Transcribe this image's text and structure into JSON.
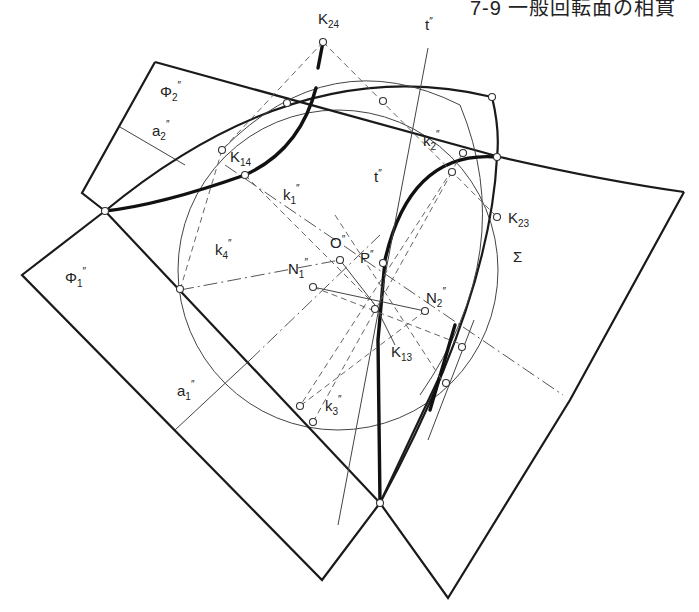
{
  "header": {
    "text": "7-9 一般回転面の相貫"
  },
  "labels": {
    "K24": {
      "main": "K",
      "sub": "24"
    },
    "Phi2": {
      "main": "Φ",
      "sub": "2",
      "prime": "″"
    },
    "a2": {
      "main": "a",
      "sub": "2",
      "prime": "″"
    },
    "K14": {
      "main": "K",
      "sub": "14"
    },
    "k2": {
      "main": "k",
      "sub": "2",
      "prime": "″"
    },
    "k1": {
      "main": "k",
      "sub": "1",
      "prime": "″"
    },
    "t_top": {
      "main": "t",
      "prime": "″"
    },
    "t_mid": {
      "main": "t",
      "prime": "″"
    },
    "K23": {
      "main": "K",
      "sub": "23"
    },
    "O": {
      "main": "O",
      "prime": "″"
    },
    "Sigma": {
      "main": "Σ"
    },
    "k4": {
      "main": "k",
      "sub": "4",
      "prime": "″"
    },
    "N1": {
      "main": "N",
      "sub": "1",
      "prime": "″"
    },
    "P": {
      "main": "P",
      "prime": "″"
    },
    "N2": {
      "main": "N",
      "sub": "2",
      "prime": "″"
    },
    "Phi1": {
      "main": "Φ",
      "sub": "1",
      "prime": "″"
    },
    "K13": {
      "main": "K",
      "sub": "13"
    },
    "a1": {
      "main": "a",
      "sub": "1",
      "prime": "″"
    },
    "k3": {
      "main": "k",
      "sub": "3",
      "prime": "″"
    }
  },
  "colors": {
    "line": "#1a1a1a",
    "construction": "#666666",
    "background": "#ffffff"
  }
}
